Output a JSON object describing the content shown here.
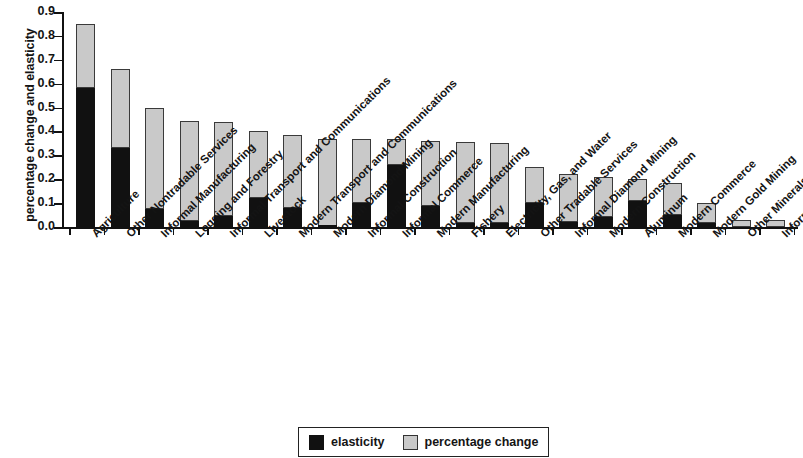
{
  "chart_data": {
    "type": "bar",
    "stacked": true,
    "title": "",
    "xlabel": "",
    "ylabel": "percentage change and elasticity",
    "ylim": [
      0.0,
      0.9
    ],
    "ytick_labels": [
      "0.0",
      "0.1",
      "0.2",
      "0.3",
      "0.4",
      "0.5",
      "0.6",
      "0.7",
      "0.8",
      "0.9"
    ],
    "ytick_values": [
      0.0,
      0.1,
      0.2,
      0.3,
      0.4,
      0.5,
      0.6,
      0.7,
      0.8,
      0.9
    ],
    "grid": false,
    "legend_position": "bottom-center",
    "categories": [
      "Agriculture",
      "Other Nontradable Services",
      "Informal Manufacturing",
      "Logging and Forestry",
      "Informal Transport and Communications",
      "Livestock",
      "Modern Transport and Communications",
      "Modern Diamond Mining",
      "Informal Construction",
      "Informal Commerce",
      "Modern Manufacturing",
      "Fishery",
      "Electricity, Gas, and Water",
      "Other Tradable Services",
      "Informal Diamond Mining",
      "Modern Construction",
      "Aluminum",
      "Modern Commerce",
      "Modern Gold Mining",
      "Other Minerals",
      "Informal Gold Mining"
    ],
    "series": [
      {
        "name": "elasticity",
        "color": "#111111",
        "values": [
          0.58,
          0.33,
          0.075,
          0.025,
          0.045,
          0.12,
          0.08,
          0.005,
          0.1,
          0.26,
          0.09,
          0.015,
          0.015,
          0.1,
          0.02,
          0.04,
          0.11,
          0.05,
          0.015,
          0.0,
          0.0
        ]
      },
      {
        "name": "percentage change",
        "color": "#c9c9c9",
        "values": [
          0.27,
          0.33,
          0.425,
          0.42,
          0.395,
          0.28,
          0.305,
          0.365,
          0.27,
          0.11,
          0.27,
          0.34,
          0.335,
          0.15,
          0.2,
          0.17,
          0.09,
          0.135,
          0.085,
          0.03,
          0.03
        ]
      }
    ],
    "totals": [
      0.85,
      0.66,
      0.5,
      0.445,
      0.44,
      0.4,
      0.385,
      0.37,
      0.37,
      0.37,
      0.36,
      0.355,
      0.35,
      0.25,
      0.22,
      0.21,
      0.2,
      0.185,
      0.1,
      0.03,
      0.03
    ]
  },
  "legend": {
    "items": [
      {
        "label": "elasticity",
        "swatch": "black-swatch"
      },
      {
        "label": "percentage change",
        "swatch": "gray-swatch"
      }
    ]
  }
}
